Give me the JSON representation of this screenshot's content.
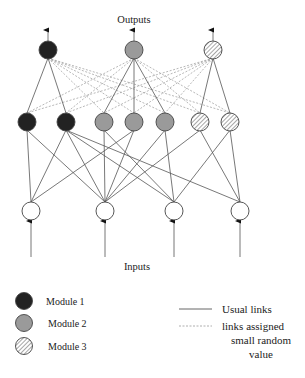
{
  "labels": {
    "outputs": "Outputs",
    "inputs": "Inputs"
  },
  "colors": {
    "module1": "#222222",
    "module2": "#9a9a9a",
    "module3_hatch": "#777777",
    "input_fill": "#ffffff"
  },
  "layers": {
    "output": [
      {
        "id": "O1",
        "x": 48,
        "y": 50,
        "module": 1
      },
      {
        "id": "O2",
        "x": 134,
        "y": 50,
        "module": 2
      },
      {
        "id": "O3",
        "x": 213,
        "y": 50,
        "module": 3
      }
    ],
    "hidden": [
      {
        "id": "H1",
        "x": 27,
        "y": 122,
        "module": 1
      },
      {
        "id": "H2",
        "x": 66,
        "y": 122,
        "module": 1
      },
      {
        "id": "H3",
        "x": 104,
        "y": 122,
        "module": 2
      },
      {
        "id": "H4",
        "x": 134,
        "y": 122,
        "module": 2
      },
      {
        "id": "H5",
        "x": 165,
        "y": 122,
        "module": 2
      },
      {
        "id": "H6",
        "x": 200,
        "y": 122,
        "module": 3
      },
      {
        "id": "H7",
        "x": 230,
        "y": 122,
        "module": 3
      }
    ],
    "input": [
      {
        "id": "I1",
        "x": 31,
        "y": 211
      },
      {
        "id": "I2",
        "x": 105,
        "y": 211
      },
      {
        "id": "I3",
        "x": 174,
        "y": 211
      },
      {
        "id": "I4",
        "x": 240,
        "y": 211
      }
    ]
  },
  "links": {
    "usual_output_hidden": [
      [
        "O1",
        "H1"
      ],
      [
        "O1",
        "H2"
      ],
      [
        "O2",
        "H3"
      ],
      [
        "O2",
        "H4"
      ],
      [
        "O2",
        "H5"
      ],
      [
        "O3",
        "H6"
      ],
      [
        "O3",
        "H7"
      ]
    ],
    "random_output_hidden": [
      [
        "O1",
        "H3"
      ],
      [
        "O1",
        "H4"
      ],
      [
        "O1",
        "H5"
      ],
      [
        "O1",
        "H6"
      ],
      [
        "O1",
        "H7"
      ],
      [
        "O2",
        "H1"
      ],
      [
        "O2",
        "H2"
      ],
      [
        "O2",
        "H6"
      ],
      [
        "O2",
        "H7"
      ],
      [
        "O3",
        "H1"
      ],
      [
        "O3",
        "H2"
      ],
      [
        "O3",
        "H3"
      ],
      [
        "O3",
        "H4"
      ],
      [
        "O3",
        "H5"
      ]
    ],
    "usual_hidden_input": [
      [
        "H1",
        "I1"
      ],
      [
        "H1",
        "I2"
      ],
      [
        "H2",
        "I1"
      ],
      [
        "H2",
        "I2"
      ],
      [
        "H2",
        "I3"
      ],
      [
        "H2",
        "I4"
      ],
      [
        "H3",
        "I2"
      ],
      [
        "H3",
        "I3"
      ],
      [
        "H4",
        "I1"
      ],
      [
        "H4",
        "I2"
      ],
      [
        "H5",
        "I2"
      ],
      [
        "H5",
        "I3"
      ],
      [
        "H6",
        "I2"
      ],
      [
        "H6",
        "I4"
      ],
      [
        "H7",
        "I3"
      ],
      [
        "H7",
        "I4"
      ]
    ]
  },
  "legend": {
    "modules": [
      {
        "label": "Module 1",
        "module": 1
      },
      {
        "label": "Module 2",
        "module": 2
      },
      {
        "label": "Module 3",
        "module": 3
      }
    ],
    "lines": {
      "usual": "Usual links",
      "random_line1": "links assigned",
      "random_line2": "small random",
      "random_line3": "value"
    }
  }
}
